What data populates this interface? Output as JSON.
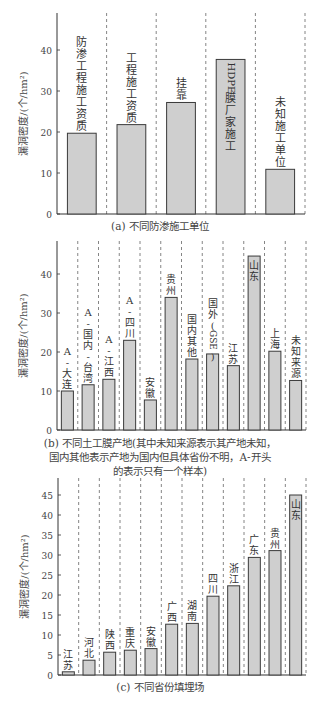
{
  "chart_data": [
    {
      "type": "bar",
      "title": "(a) 不同防渗施工单位",
      "ylabel": "漏洞密度/(个/hm²)",
      "xlabel": "",
      "ylim": [
        0,
        48
      ],
      "yticks": [
        0,
        10,
        20,
        30,
        40
      ],
      "grid": false,
      "separators": "dashed vertical lines between bars",
      "categories": [
        "防渗工程施工资质",
        "工程施工资质",
        "挂靠",
        "HDPE膜厂家施工",
        "未知施工单位"
      ],
      "values": [
        19.7,
        21.8,
        27.2,
        37.7,
        10.9
      ],
      "label_inside": [
        false,
        false,
        false,
        true,
        false
      ]
    },
    {
      "type": "bar",
      "title": "(b) 不同土工膜产地(其中未知来源表示其产地未知，国内其他表示产地为国内但具体省份不明，A-开头的表示只有一个样本)",
      "ylabel": "漏洞密度/(个/hm²)",
      "xlabel": "",
      "ylim": [
        0,
        48
      ],
      "yticks": [
        0,
        10,
        20,
        30,
        40
      ],
      "grid": false,
      "separators": "dashed vertical lines between bars",
      "categories": [
        "A-大连",
        "A-国内-台湾",
        "A-江西",
        "A-四川",
        "安徽",
        "贵州",
        "国内其他",
        "国外(GSE)",
        "江苏",
        "山东",
        "上海",
        "未知来源"
      ],
      "values": [
        10.0,
        11.6,
        13.0,
        23.0,
        7.7,
        34.0,
        18.2,
        19.5,
        16.5,
        44.6,
        20.2,
        12.7
      ],
      "label_inside": [
        false,
        false,
        false,
        false,
        false,
        false,
        false,
        false,
        false,
        true,
        false,
        false
      ]
    },
    {
      "type": "bar",
      "title": "(c) 不同省份填埋场",
      "ylabel": "漏洞密度/(个/hm²)",
      "xlabel": "",
      "ylim": [
        0,
        49
      ],
      "yticks": [
        0,
        5,
        10,
        15,
        20,
        25,
        30,
        35,
        40,
        45
      ],
      "grid": false,
      "separators": "dashed vertical lines between bars",
      "categories": [
        "江苏",
        "河北",
        "陕西",
        "重庆",
        "安徽",
        "广西",
        "湖南",
        "四川",
        "浙江",
        "广东",
        "贵州",
        "山东"
      ],
      "values": [
        0.8,
        3.7,
        5.7,
        6.2,
        6.6,
        12.7,
        12.9,
        19.7,
        22.3,
        29.4,
        31.1,
        45.0
      ],
      "label_inside": [
        false,
        false,
        false,
        false,
        false,
        false,
        false,
        false,
        false,
        false,
        false,
        true
      ]
    }
  ],
  "layout": [
    {
      "top": 8,
      "height": 212,
      "axisX": 57,
      "rightX": 305,
      "baseY": 214,
      "topY": 13,
      "pxPerUnit": 4.1,
      "captionTop": 219,
      "captionLines": [
        "(a) 不同防渗施工单位"
      ]
    },
    {
      "top": 236,
      "height": 200,
      "axisX": 57,
      "rightX": 306,
      "baseY": 430,
      "topY": 241,
      "pxPerUnit": 3.9,
      "captionTop": 436,
      "captionLines": [
        "(b) 不同土工膜产地(其中未知来源表示其产地未知，",
        "国内其他表示产地为国内但具体省份不明，A-开头",
        "的表示只有一个样本)"
      ]
    },
    {
      "top": 474,
      "height": 204,
      "axisX": 58,
      "rightX": 306,
      "baseY": 675,
      "topY": 478,
      "pxPerUnit": 4.0,
      "captionTop": 680,
      "captionLines": [
        "(c) 不同省份填埋场"
      ]
    }
  ],
  "style": {
    "bar_fill": "#cfcfcf",
    "bar_stroke": "#3a3a3a",
    "axis_color": "#333333",
    "dash_color": "#666666",
    "text_color": "#444444"
  }
}
